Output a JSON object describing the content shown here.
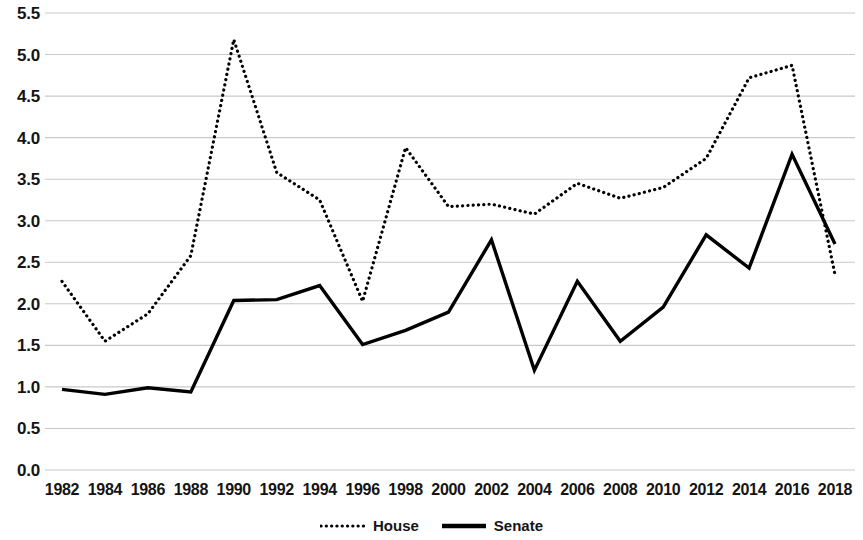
{
  "chart_data": {
    "type": "line",
    "title": "",
    "subtitle": "",
    "xlabel": "",
    "ylabel": "",
    "xlim": [
      1982,
      2018
    ],
    "ylim": [
      0.0,
      5.5
    ],
    "grid": true,
    "legend_position": "bottom-center",
    "categories": [
      1982,
      1984,
      1986,
      1988,
      1990,
      1992,
      1994,
      1996,
      1998,
      2000,
      2002,
      2004,
      2006,
      2008,
      2010,
      2012,
      2014,
      2016,
      2018
    ],
    "x_tick_labels": [
      "1982",
      "1984",
      "1986",
      "1988",
      "1990",
      "1992",
      "1994",
      "1996",
      "1998",
      "2000",
      "2002",
      "2004",
      "2006",
      "2008",
      "2010",
      "2012",
      "2014",
      "2016",
      "2018"
    ],
    "y_tick_labels": [
      "5.5",
      "5.0",
      "4.5",
      "4.0",
      "3.5",
      "3.0",
      "2.5",
      "2.0",
      "1.5",
      "1.0",
      "0.5",
      "0.0"
    ],
    "y_tick_values": [
      5.5,
      5.0,
      4.5,
      4.0,
      3.5,
      3.0,
      2.5,
      2.0,
      1.5,
      1.0,
      0.5,
      0.0
    ],
    "series": [
      {
        "name": "House",
        "style": "dotted",
        "color": "#000000",
        "values": [
          2.27,
          1.55,
          1.88,
          2.58,
          5.18,
          3.58,
          3.25,
          2.03,
          3.88,
          3.17,
          3.2,
          3.08,
          3.45,
          3.27,
          3.4,
          3.75,
          4.72,
          4.87,
          2.35
        ]
      },
      {
        "name": "Senate",
        "style": "solid",
        "color": "#000000",
        "values": [
          0.97,
          0.91,
          0.99,
          0.94,
          2.04,
          2.05,
          2.22,
          1.51,
          1.68,
          1.9,
          2.77,
          1.2,
          2.27,
          1.55,
          1.96,
          2.83,
          2.43,
          3.8,
          2.72
        ]
      }
    ]
  },
  "legend": {
    "entries": [
      {
        "label": "House",
        "style": "dotted"
      },
      {
        "label": "Senate",
        "style": "solid"
      }
    ]
  },
  "colors": {
    "gridline": "#c9c9c9",
    "text": "#141414",
    "line": "#000000",
    "background": "#ffffff"
  }
}
